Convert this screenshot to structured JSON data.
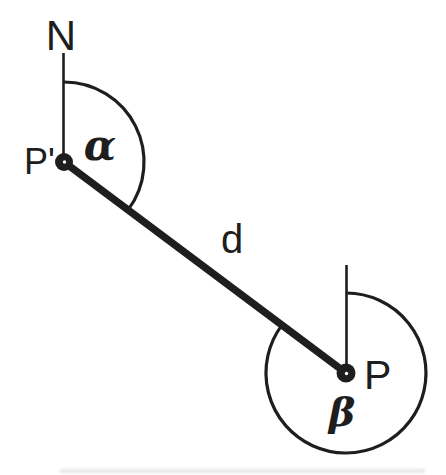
{
  "diagram": {
    "colors": {
      "ink": "#1e1e1e",
      "background": "#ffffff"
    },
    "labels": {
      "north": "N",
      "point_from": "P'",
      "point_to": "P",
      "angle_at_p_prime": "α",
      "angle_at_p": "β",
      "distance": "d"
    }
  }
}
